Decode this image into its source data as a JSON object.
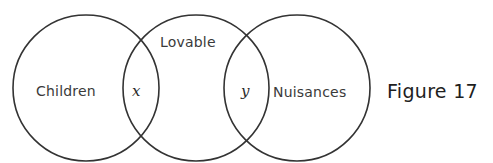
{
  "diagram": {
    "type": "venn",
    "sets": [
      {
        "label": "Children",
        "cx": 86,
        "cy": 88,
        "r": 73
      },
      {
        "label": "Lovable",
        "cx": 196,
        "cy": 88,
        "r": 73
      },
      {
        "label": "Nuisances",
        "cx": 297,
        "cy": 88,
        "r": 73
      }
    ],
    "regions": [
      {
        "label": "x",
        "between": [
          "Children",
          "Lovable"
        ]
      },
      {
        "label": "y",
        "between": [
          "Lovable",
          "Nuisances"
        ]
      }
    ],
    "caption": "Figure 17",
    "stroke_color": "#333333"
  }
}
